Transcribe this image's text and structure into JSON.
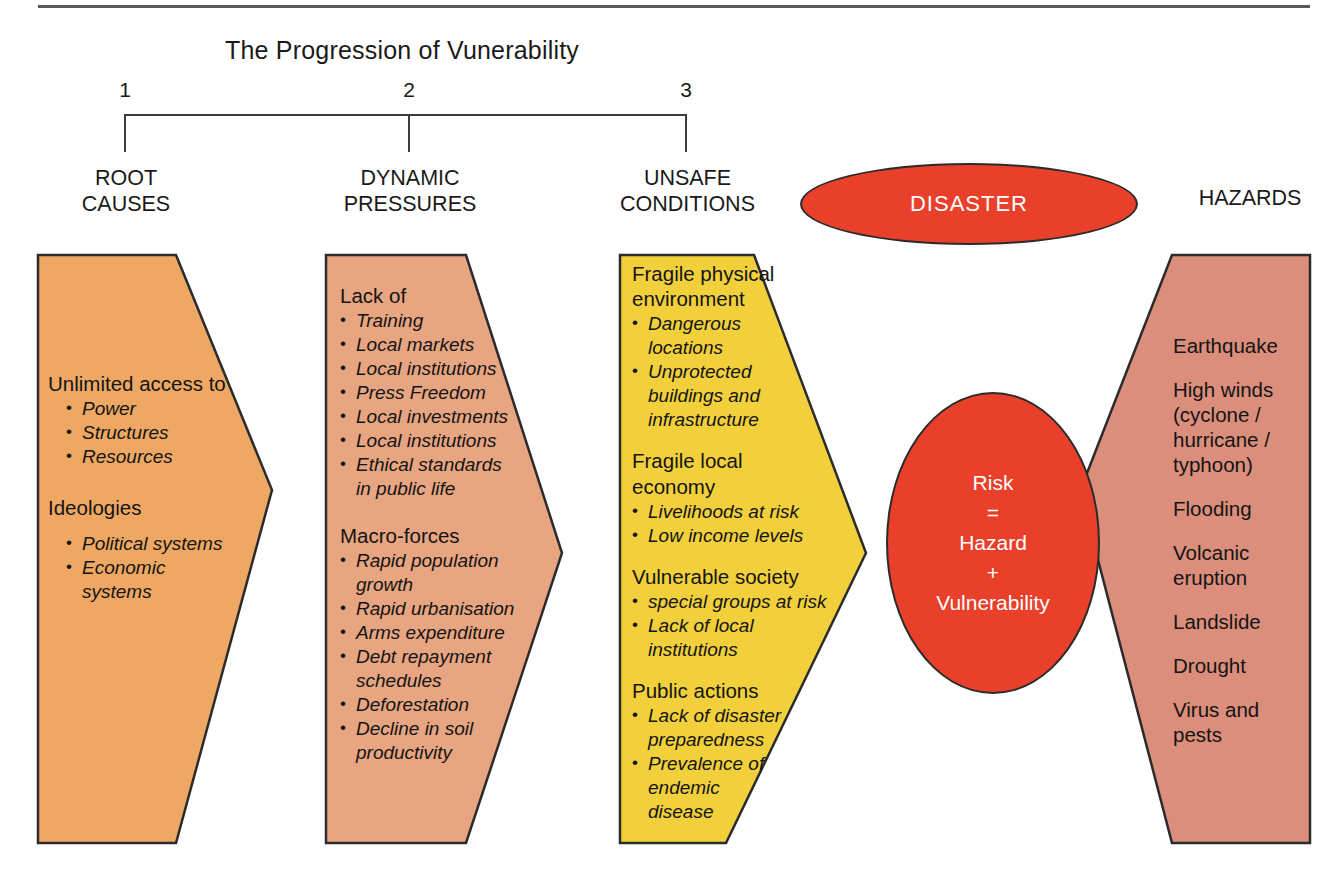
{
  "title": "The Progression of Vunerability",
  "colors": {
    "root_causes": "#EFA863",
    "dynamic_pressures": "#E8A581",
    "unsafe_conditions": "#F2D03C",
    "hazards": "#DB8E7B",
    "disaster": "#E8402A",
    "outline": "#2b2b2b"
  },
  "bracket": {
    "numbers": [
      "1",
      "2",
      "3"
    ]
  },
  "columns": {
    "root_causes": {
      "head": "ROOT\nCAUSES",
      "blocks": [
        {
          "title": "Unlimited\naccess to",
          "items": [
            "Power",
            "Structures",
            "Resources"
          ]
        },
        {
          "title": "Ideologies",
          "items": [
            "Political systems",
            "Economic systems"
          ]
        }
      ]
    },
    "dynamic_pressures": {
      "head": "DYNAMIC\nPRESSURES",
      "blocks": [
        {
          "title": "Lack of",
          "items": [
            "Training",
            "Local markets",
            "Local institutions",
            "Press Freedom",
            "Local investments",
            "Local institutions",
            "Ethical standards",
            "in public life"
          ]
        },
        {
          "title": "Macro-forces",
          "items": [
            "Rapid population",
            "growth",
            "Rapid urbanisation",
            "Arms expenditure",
            "Debt repayment",
            "schedules",
            "Deforestation",
            "Decline in soil",
            "productivity"
          ]
        }
      ]
    },
    "unsafe_conditions": {
      "head": "UNSAFE\nCONDITIONS",
      "blocks": [
        {
          "title": "Fragile\nphysical\nenvironment",
          "items": [
            "Dangerous",
            "locations",
            "Unprotected",
            "buildings and",
            "infrastructure"
          ]
        },
        {
          "title": "Fragile local",
          "title2": "economy",
          "items": [
            "Livelihoods at risk",
            "Low income levels"
          ]
        },
        {
          "title": "Vulnerable society",
          "items": [
            "special groups at risk",
            "Lack of local",
            "institutions"
          ]
        },
        {
          "title": "Public actions",
          "items": [
            "Lack of disaster",
            "preparedness",
            "Prevalence of",
            "endemic",
            "disease"
          ]
        }
      ]
    },
    "hazards": {
      "head": "HAZARDS",
      "items": [
        "Earthquake",
        "High winds\n(cyclone /\nhurricane /\ntyphoon)",
        "Flooding",
        "Volcanic\neruption",
        "Landslide",
        "Drought",
        "Virus and\npests"
      ]
    }
  },
  "ellipses": {
    "disaster": "DISASTER",
    "risk": "Risk\n=\nHazard\n+\nVulnerability"
  }
}
